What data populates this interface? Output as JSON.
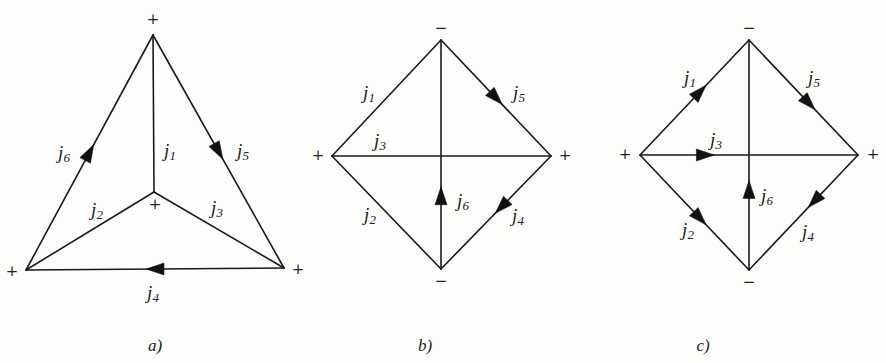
{
  "figures": [
    {
      "id": "a",
      "caption": "a)",
      "nodes": [
        {
          "name": "top",
          "x": 153,
          "y": 35,
          "sign": "+",
          "sx": 153,
          "sy": 20
        },
        {
          "name": "center",
          "x": 154,
          "y": 192,
          "sign": "+",
          "sx": 155,
          "sy": 205
        },
        {
          "name": "bottom-left",
          "x": 26,
          "y": 270,
          "sign": "+",
          "sx": 12,
          "sy": 272
        },
        {
          "name": "bottom-right",
          "x": 284,
          "y": 268,
          "sign": "+",
          "sx": 298,
          "sy": 270
        }
      ],
      "edges": [
        {
          "label": "j",
          "sub": "1",
          "from": "top",
          "to": "center",
          "arrow": null,
          "lx": 170,
          "ly": 153
        },
        {
          "label": "j",
          "sub": "2",
          "from": "center",
          "to": "bottom-left",
          "arrow": null,
          "lx": 97,
          "ly": 212
        },
        {
          "label": "j",
          "sub": "3",
          "from": "center",
          "to": "bottom-right",
          "arrow": null,
          "lx": 217,
          "ly": 210
        },
        {
          "label": "j",
          "sub": "4",
          "from": "bottom-right",
          "to": "bottom-left",
          "arrow": 0.5,
          "lx": 153,
          "ly": 295
        },
        {
          "label": "j",
          "sub": "5",
          "from": "top",
          "to": "bottom-right",
          "arrow": 0.5,
          "lx": 243,
          "ly": 153
        },
        {
          "label": "j",
          "sub": "6",
          "from": "bottom-left",
          "to": "top",
          "arrow": 0.5,
          "lx": 64,
          "ly": 155
        }
      ],
      "caption_pos": {
        "x": 155,
        "y": 347
      }
    },
    {
      "id": "b",
      "caption": "b)",
      "nodes": [
        {
          "name": "top",
          "x": 441,
          "y": 40,
          "sign": "−",
          "sx": 441,
          "sy": 29
        },
        {
          "name": "left",
          "x": 332,
          "y": 156,
          "sign": "+",
          "sx": 318,
          "sy": 156
        },
        {
          "name": "right",
          "x": 551,
          "y": 156,
          "sign": "+",
          "sx": 565,
          "sy": 156
        },
        {
          "name": "bottom",
          "x": 441,
          "y": 269,
          "sign": "−",
          "sx": 441,
          "sy": 282
        }
      ],
      "edges": [
        {
          "label": "j",
          "sub": "1",
          "from": "left",
          "to": "top",
          "arrow": null,
          "lx": 369,
          "ly": 95
        },
        {
          "label": "j",
          "sub": "2",
          "from": "left",
          "to": "bottom",
          "arrow": null,
          "lx": 370,
          "ly": 217
        },
        {
          "label": "j",
          "sub": "3",
          "from": "left",
          "to": "right",
          "arrow": null,
          "lx": 380,
          "ly": 143
        },
        {
          "label": "j",
          "sub": "4",
          "from": "right",
          "to": "bottom",
          "arrow": 0.45,
          "lx": 518,
          "ly": 218
        },
        {
          "label": "j",
          "sub": "5",
          "from": "top",
          "to": "right",
          "arrow": 0.5,
          "lx": 519,
          "ly": 95
        },
        {
          "label": "j",
          "sub": "6",
          "from": "bottom",
          "to": "top",
          "arrow": 0.32,
          "lx": 463,
          "ly": 203
        }
      ],
      "caption_pos": {
        "x": 425,
        "y": 347
      }
    },
    {
      "id": "c",
      "caption": "c)",
      "nodes": [
        {
          "name": "top",
          "x": 749,
          "y": 40,
          "sign": "−",
          "sx": 749,
          "sy": 29
        },
        {
          "name": "left",
          "x": 640,
          "y": 155,
          "sign": "+",
          "sx": 625,
          "sy": 155
        },
        {
          "name": "right",
          "x": 858,
          "y": 155,
          "sign": "+",
          "sx": 873,
          "sy": 155
        },
        {
          "name": "bottom",
          "x": 749,
          "y": 270,
          "sign": "−",
          "sx": 749,
          "sy": 283
        }
      ],
      "edges": [
        {
          "label": "j",
          "sub": "1",
          "from": "left",
          "to": "top",
          "arrow": 0.55,
          "lx": 690,
          "ly": 80
        },
        {
          "label": "j",
          "sub": "2",
          "from": "left",
          "to": "bottom",
          "arrow": 0.55,
          "lx": 688,
          "ly": 232
        },
        {
          "label": "j",
          "sub": "3",
          "from": "left",
          "to": "right",
          "arrow": 0.3,
          "lx": 716,
          "ly": 142
        },
        {
          "label": "j",
          "sub": "4",
          "from": "right",
          "to": "bottom",
          "arrow": 0.4,
          "lx": 808,
          "ly": 234
        },
        {
          "label": "j",
          "sub": "5",
          "from": "top",
          "to": "right",
          "arrow": 0.55,
          "lx": 814,
          "ly": 80
        },
        {
          "label": "j",
          "sub": "6",
          "from": "bottom",
          "to": "top",
          "arrow": 0.35,
          "lx": 767,
          "ly": 198
        }
      ],
      "caption_pos": {
        "x": 703,
        "y": 347
      }
    }
  ]
}
